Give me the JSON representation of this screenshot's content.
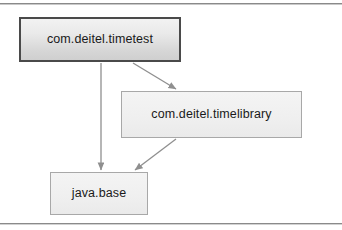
{
  "diagram": {
    "type": "module-dependency-graph",
    "frame": {
      "visible": true,
      "color": "#8a8a8a"
    },
    "nodes": [
      {
        "id": "timetest",
        "label": "com.deitel.timetest",
        "style": "primary",
        "border_color": "#4a4a4a",
        "fill_color": "#e3e3e3"
      },
      {
        "id": "timelibrary",
        "label": "com.deitel.timelibrary",
        "style": "secondary",
        "border_color": "#a8a8a8",
        "fill_color": "#efefef"
      },
      {
        "id": "javabase",
        "label": "java.base",
        "style": "secondary",
        "border_color": "#a8a8a8",
        "fill_color": "#efefef"
      }
    ],
    "edges": [
      {
        "from": "timetest",
        "to": "timelibrary",
        "arrow": "filled",
        "color": "#8f8f8f"
      },
      {
        "from": "timetest",
        "to": "javabase",
        "arrow": "filled",
        "color": "#8f8f8f"
      },
      {
        "from": "timelibrary",
        "to": "javabase",
        "arrow": "filled",
        "color": "#8f8f8f"
      }
    ]
  }
}
